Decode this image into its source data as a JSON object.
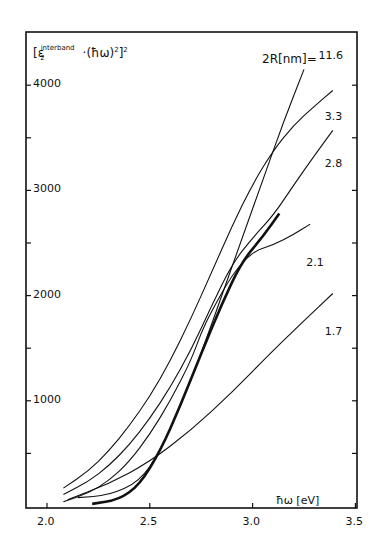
{
  "chart_data": {
    "type": "line",
    "title": "",
    "ylabel": "[ε2^interband · (ħω)^2]^2",
    "xlabel": "ħω [eV]",
    "legend_title": "2R[nm]=",
    "xlim": [
      2.0,
      3.5
    ],
    "ylim": [
      0,
      4300
    ],
    "x_ticks": [
      "2.0",
      "2.5",
      "3.0",
      "3.5"
    ],
    "y_ticks": [
      "1000",
      "2000",
      "3000",
      "4000"
    ],
    "grid": false,
    "series": [
      {
        "name": "11.6",
        "points": [
          [
            2.15,
            80
          ],
          [
            2.3,
            100
          ],
          [
            2.45,
            230
          ],
          [
            2.55,
            520
          ],
          [
            2.65,
            950
          ],
          [
            2.75,
            1450
          ],
          [
            2.85,
            2000
          ],
          [
            2.95,
            2550
          ],
          [
            3.05,
            3100
          ],
          [
            3.15,
            3650
          ],
          [
            3.25,
            4150
          ],
          [
            3.35,
            4700
          ]
        ],
        "label_pos": [
          3.35,
          4270
        ]
      },
      {
        "name": "3.3",
        "points": [
          [
            2.08,
            170
          ],
          [
            2.2,
            330
          ],
          [
            2.3,
            520
          ],
          [
            2.4,
            760
          ],
          [
            2.5,
            1040
          ],
          [
            2.6,
            1380
          ],
          [
            2.7,
            1780
          ],
          [
            2.8,
            2220
          ],
          [
            2.9,
            2660
          ],
          [
            3.0,
            3060
          ],
          [
            3.1,
            3380
          ],
          [
            3.2,
            3620
          ],
          [
            3.3,
            3800
          ],
          [
            3.39,
            3950
          ]
        ],
        "label_pos": [
          3.38,
          3690
        ]
      },
      {
        "name": "2.8",
        "points": [
          [
            2.08,
            110
          ],
          [
            2.2,
            230
          ],
          [
            2.3,
            380
          ],
          [
            2.4,
            580
          ],
          [
            2.5,
            830
          ],
          [
            2.6,
            1130
          ],
          [
            2.7,
            1480
          ],
          [
            2.8,
            1900
          ],
          [
            2.9,
            2300
          ],
          [
            3.0,
            2550
          ],
          [
            3.1,
            2760
          ],
          [
            3.2,
            3050
          ],
          [
            3.3,
            3330
          ],
          [
            3.39,
            3570
          ]
        ],
        "label_pos": [
          3.38,
          3240
        ]
      },
      {
        "name": "2.1",
        "points": [
          [
            2.08,
            40
          ],
          [
            2.2,
            120
          ],
          [
            2.3,
            240
          ],
          [
            2.4,
            420
          ],
          [
            2.5,
            680
          ],
          [
            2.6,
            1000
          ],
          [
            2.7,
            1380
          ],
          [
            2.75,
            1650
          ],
          [
            2.8,
            1850
          ],
          [
            2.9,
            2200
          ],
          [
            3.0,
            2420
          ],
          [
            3.1,
            2480
          ],
          [
            3.2,
            2580
          ],
          [
            3.28,
            2680
          ]
        ],
        "label_pos": [
          3.29,
          2300
        ]
      },
      {
        "name": "1.7",
        "points": [
          [
            2.1,
            60
          ],
          [
            2.3,
            210
          ],
          [
            2.5,
            420
          ],
          [
            2.7,
            720
          ],
          [
            2.9,
            1080
          ],
          [
            3.1,
            1480
          ],
          [
            3.25,
            1760
          ],
          [
            3.39,
            2020
          ]
        ],
        "label_pos": [
          3.38,
          1640
        ]
      },
      {
        "name": "bulk (bold)",
        "points": [
          [
            2.22,
            20
          ],
          [
            2.35,
            60
          ],
          [
            2.45,
            200
          ],
          [
            2.55,
            520
          ],
          [
            2.65,
            960
          ],
          [
            2.75,
            1450
          ],
          [
            2.85,
            1920
          ],
          [
            2.95,
            2330
          ],
          [
            3.05,
            2560
          ],
          [
            3.13,
            2780
          ]
        ],
        "bold": true
      }
    ]
  }
}
